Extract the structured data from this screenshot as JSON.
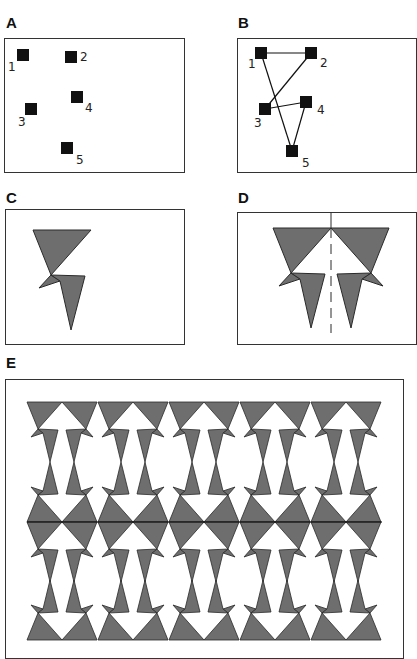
{
  "panels": {
    "A": {
      "label": "A",
      "points": [
        {
          "id": "1",
          "x": 23,
          "y": 55,
          "lx": 8,
          "ly": 71
        },
        {
          "id": "2",
          "x": 71,
          "y": 57,
          "lx": 80,
          "ly": 61
        },
        {
          "id": "3",
          "x": 31,
          "y": 109,
          "lx": 18,
          "ly": 126
        },
        {
          "id": "4",
          "x": 77,
          "y": 97,
          "lx": 85,
          "ly": 112
        },
        {
          "id": "5",
          "x": 67,
          "y": 148,
          "lx": 76,
          "ly": 164
        }
      ]
    },
    "B": {
      "label": "B",
      "points": [
        {
          "id": "1",
          "x": 261,
          "y": 53,
          "lx": 248,
          "ly": 68
        },
        {
          "id": "2",
          "x": 311,
          "y": 53,
          "lx": 320,
          "ly": 67
        },
        {
          "id": "3",
          "x": 265,
          "y": 109,
          "lx": 254,
          "ly": 127
        },
        {
          "id": "4",
          "x": 306,
          "y": 102,
          "lx": 317,
          "ly": 114
        },
        {
          "id": "5",
          "x": 292,
          "y": 151,
          "lx": 302,
          "ly": 167
        }
      ],
      "edges": [
        [
          "1",
          "2"
        ],
        [
          "2",
          "3"
        ],
        [
          "3",
          "4"
        ],
        [
          "4",
          "5"
        ],
        [
          "1",
          "5"
        ]
      ]
    },
    "C": {
      "label": "C"
    },
    "D": {
      "label": "D"
    },
    "E": {
      "label": "E",
      "columns": 5,
      "rows": 2
    },
    "colors": {
      "fill": "#6e6e6e",
      "stroke": "#2a2a2a",
      "border": "#333333"
    }
  }
}
